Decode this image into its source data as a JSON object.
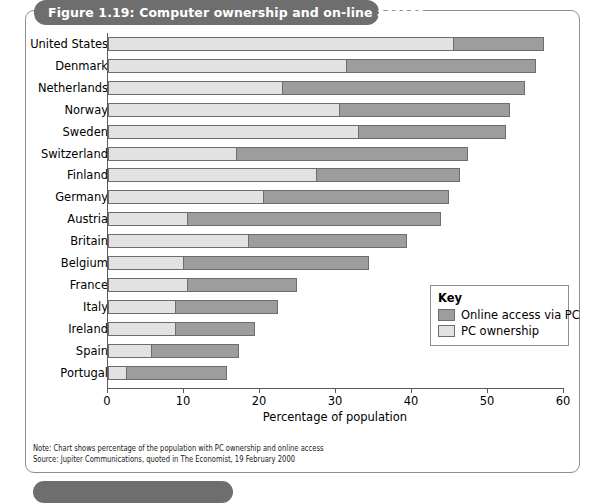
{
  "figure": {
    "title": "Figure 1.19: Computer ownership and on-line access"
  },
  "legend": {
    "title": "Key",
    "items": [
      {
        "label": "Online access via PC",
        "color": "#9d9d9d"
      },
      {
        "label": "PC ownership",
        "color": "#e2e2e2"
      }
    ]
  },
  "notes": {
    "note": "Note: Chart shows percentage of the population with PC ownership and online access",
    "source": "Source: Jupiter Communications, quoted in The Economist, 19 February 2000"
  },
  "chart_data": {
    "type": "bar",
    "orientation": "horizontal",
    "stacked": true,
    "title": "Figure 1.19: Computer ownership and on-line access",
    "xlabel": "Percentage of population",
    "ylabel": "",
    "xlim": [
      0,
      60
    ],
    "xticks": [
      0,
      10,
      20,
      30,
      40,
      50,
      60
    ],
    "grid": false,
    "legend_position": "inside-right",
    "categories": [
      "United States",
      "Denmark",
      "Netherlands",
      "Norway",
      "Sweden",
      "Switzerland",
      "Finland",
      "Germany",
      "Austria",
      "Britain",
      "Belgium",
      "France",
      "Italy",
      "Ireland",
      "Spain",
      "Portugal"
    ],
    "series": [
      {
        "name": "PC ownership",
        "color": "#e2e2e2",
        "values": [
          45.5,
          31.5,
          23.0,
          30.5,
          33.0,
          17.0,
          27.5,
          20.5,
          10.5,
          18.5,
          10.0,
          10.5,
          9.0,
          9.0,
          5.8,
          2.5
        ]
      },
      {
        "name": "Online access via PC",
        "color": "#9d9d9d",
        "values": [
          12.0,
          24.9,
          32.0,
          22.5,
          19.5,
          30.5,
          19.0,
          24.5,
          33.5,
          21.0,
          24.5,
          14.5,
          13.5,
          10.5,
          11.6,
          13.3
        ]
      }
    ],
    "totals": [
      57.5,
      56.4,
      55.0,
      53.0,
      52.5,
      47.5,
      46.5,
      45.0,
      44.0,
      39.5,
      34.5,
      25.0,
      22.5,
      19.5,
      17.4,
      15.8
    ]
  }
}
